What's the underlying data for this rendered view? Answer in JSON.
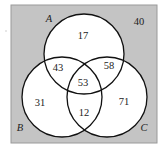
{
  "diagram": {
    "type": "venn-3-set",
    "colors": {
      "universe_fill": "#c4c4c4",
      "universe_border": "#9a9a9a",
      "circle_fill": "#ffffff",
      "circle_stroke": "#111111",
      "text": "#222222"
    },
    "universe": {
      "outside_value": "40"
    },
    "sets": {
      "A": {
        "label": "A"
      },
      "B": {
        "label": "B"
      },
      "C": {
        "label": "C"
      }
    },
    "regions": {
      "A_only": "17",
      "B_only": "31",
      "C_only": "71",
      "A_and_B_only": "43",
      "A_and_C_only": "58",
      "B_and_C_only": "12",
      "A_and_B_and_C": "53"
    }
  }
}
